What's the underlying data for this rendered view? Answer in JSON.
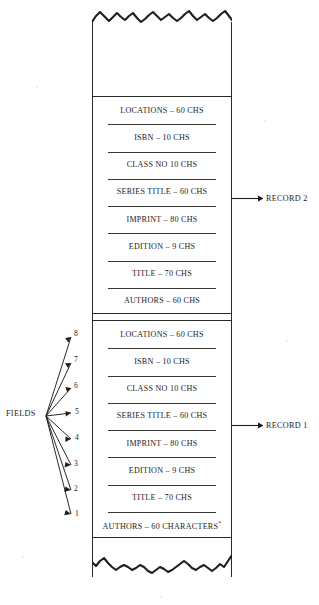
{
  "figure": {
    "paper_color": "#ffffff",
    "ink_color": "#1d1d1d"
  },
  "fields_callout": {
    "label": "FIELDS",
    "numbers": [
      "8",
      "7",
      "6",
      "5",
      "4",
      "3",
      "2",
      "1"
    ]
  },
  "records": [
    {
      "id": "record-2",
      "callout_label": "RECORD 2",
      "fields": [
        {
          "name": "LOCATIONS",
          "separator": "–",
          "size": "60 CHS"
        },
        {
          "name": "ISBN",
          "separator": "–",
          "size": "10 CHS"
        },
        {
          "name": "CLASS NO",
          "separator": "",
          "size": "10 CHS"
        },
        {
          "name": "SERIES TITLE",
          "separator": "–",
          "size": "60 CHS"
        },
        {
          "name": "IMPRINT",
          "separator": "–",
          "size": "80 CHS"
        },
        {
          "name": "EDITION",
          "separator": "–",
          "size": "9 CHS"
        },
        {
          "name": "TITLE",
          "separator": "–",
          "size": "70 CHS"
        },
        {
          "name": "AUTHORS",
          "separator": "–",
          "size": "60 CHS"
        }
      ],
      "rows_text": [
        "LOCATIONS – 60 CHS",
        "ISBN – 10 CHS",
        "CLASS NO  10 CHS",
        "SERIES TITLE – 60 CHS",
        "IMPRINT – 80 CHS",
        "EDITION – 9 CHS",
        "TITLE – 70 CHS",
        "AUTHORS – 60 CHS"
      ]
    },
    {
      "id": "record-1",
      "callout_label": "RECORD 1",
      "fields": [
        {
          "name": "LOCATIONS",
          "separator": "–",
          "size": "60 CHS",
          "number": "8"
        },
        {
          "name": "ISBN",
          "separator": "–",
          "size": "10 CHS",
          "number": "7"
        },
        {
          "name": "CLASS NO",
          "separator": "",
          "size": "10 CHS",
          "number": "6"
        },
        {
          "name": "SERIES TITLE",
          "separator": "–",
          "size": "60 CHS",
          "number": "5"
        },
        {
          "name": "IMPRINT",
          "separator": "–",
          "size": "80 CHS",
          "number": "4"
        },
        {
          "name": "EDITION",
          "separator": "–",
          "size": "9 CHS",
          "number": "3"
        },
        {
          "name": "TITLE",
          "separator": "–",
          "size": "70 CHS",
          "number": "2"
        },
        {
          "name": "AUTHORS",
          "separator": "–",
          "size": "60 CHARACTERS",
          "number": "1",
          "footnote": "*"
        }
      ],
      "rows_text": [
        "LOCATIONS – 60 CHS",
        "ISBN – 10 CHS",
        "CLASS NO  10 CHS",
        "SERIES TITLE – 60 CHS",
        "IMPRINT – 80 CHS",
        "EDITION – 9 CHS",
        "TITLE – 70 CHS",
        "AUTHORS – 60 CHARACTERS"
      ]
    }
  ],
  "footnote_marker": "*"
}
